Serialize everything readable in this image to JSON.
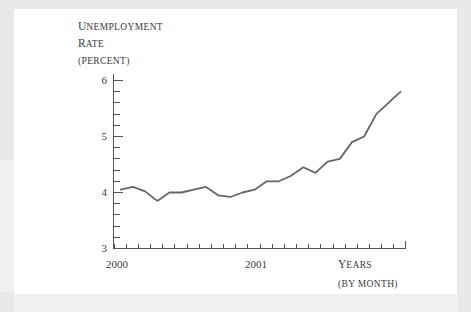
{
  "figure": {
    "y_axis_title_lines": [
      "UNEMPLOYMENT",
      "RATE",
      "(PERCENT)"
    ],
    "x_axis_title_lines": [
      "YEARS",
      "(BY MONTH)"
    ]
  },
  "chart_data": {
    "type": "line",
    "title": "",
    "subtitle": "",
    "xlabel": "Years (by month)",
    "ylabel": "Unemployment rate (percent)",
    "ylim": [
      3,
      6
    ],
    "yticks": [
      3,
      4,
      5,
      6
    ],
    "yticklabels": [
      "3",
      "4",
      "5",
      "6"
    ],
    "y_minor_tick_step": 0.2,
    "xlim": [
      "2000-01",
      "2001-12"
    ],
    "xticks": [
      "2000",
      "2001"
    ],
    "xticklabels": [
      "2000",
      "2001"
    ],
    "x_minor_tick_step": "1 month",
    "grid": false,
    "legend": "none",
    "line_color": "#666666",
    "line_width": 1.8,
    "x": [
      "2000-01",
      "2000-02",
      "2000-03",
      "2000-04",
      "2000-05",
      "2000-06",
      "2000-07",
      "2000-08",
      "2000-09",
      "2000-10",
      "2000-11",
      "2000-12",
      "2001-01",
      "2001-02",
      "2001-03",
      "2001-04",
      "2001-05",
      "2001-06",
      "2001-07",
      "2001-08",
      "2001-09",
      "2001-10",
      "2001-11",
      "2001-12"
    ],
    "series": [
      {
        "name": "Unemployment rate",
        "values": [
          4.05,
          4.1,
          4.02,
          3.85,
          4.0,
          4.0,
          4.05,
          4.1,
          3.95,
          3.92,
          4.0,
          4.05,
          4.2,
          4.2,
          4.3,
          4.45,
          4.35,
          4.55,
          4.6,
          4.9,
          5.0,
          5.4,
          5.6,
          5.8
        ]
      }
    ]
  }
}
